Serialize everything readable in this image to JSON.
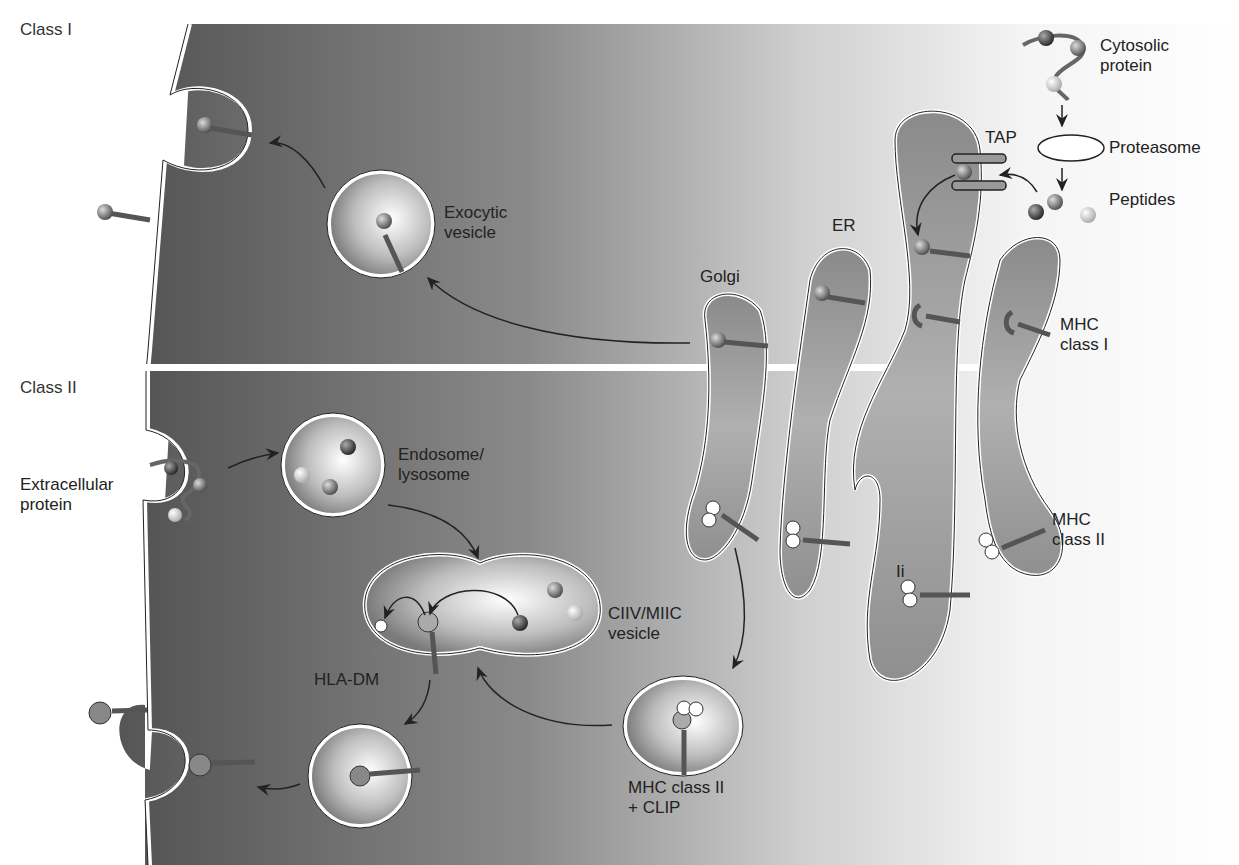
{
  "figure": {
    "sections": {
      "class_i": "Class I",
      "class_ii": "Class II"
    },
    "labels": {
      "cytosolic_protein": "Cytosolic\nprotein",
      "proteasome": "Proteasome",
      "peptides": "Peptides",
      "tap": "TAP",
      "er": "ER",
      "golgi": "Golgi",
      "exocytic_vesicle": "Exocytic\nvesicle",
      "mhc_class_i": "MHC\nclass I",
      "extracellular_protein": "Extracellular\nprotein",
      "endosome_lysosome": "Endosome/\nlysosome",
      "ciiv_miic_vesicle": "CIIV/MIIC\nvesicle",
      "hla_dm": "HLA-DM",
      "mhc_class_ii": "MHC\nclass II",
      "ii": "Ii",
      "mhc_class_ii_clip": "MHC class II\n+ CLIP"
    },
    "colors": {
      "cytoplasm_dark": "#5a5a5a",
      "cytoplasm_light": "#e8e8e8",
      "organelle_fill": "#9a9a9a",
      "membrane": "#ffffff",
      "outline": "#222222"
    }
  }
}
